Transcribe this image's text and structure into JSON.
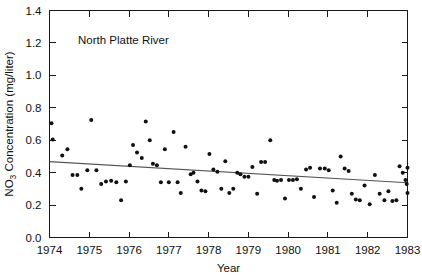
{
  "chart_data": {
    "type": "scatter",
    "title": "",
    "annotation": "North Platte River",
    "xlabel": "Year",
    "ylabel_main": "Concentration (mg/liter)",
    "ylabel_prefix": "NO",
    "ylabel_subscript": "3",
    "xlim": [
      1974,
      1983
    ],
    "ylim": [
      0.0,
      1.4
    ],
    "xticks": [
      1974,
      1975,
      1976,
      1977,
      1978,
      1979,
      1980,
      1981,
      1982,
      1983
    ],
    "xtick_labels": [
      "1974",
      "1975",
      "1976",
      "1977",
      "1978",
      "1979",
      "1980",
      "1981",
      "1982",
      "1983"
    ],
    "yticks": [
      0.0,
      0.2,
      0.4,
      0.6,
      0.8,
      1.0,
      1.2,
      1.4
    ],
    "ytick_labels": [
      "0.0",
      "0.2",
      "0.4",
      "0.6",
      "0.8",
      "1.0",
      "1.2",
      "1.4"
    ],
    "grid": false,
    "legend": "none",
    "marker": "filled-circle",
    "marker_color": "#111111",
    "trendline": {
      "color": "#555555",
      "x": [
        1974.0,
        1983.0
      ],
      "y": [
        0.468,
        0.338
      ]
    },
    "points": [
      {
        "x": 1974.05,
        "y": 0.705
      },
      {
        "x": 1974.08,
        "y": 0.605
      },
      {
        "x": 1974.32,
        "y": 0.505
      },
      {
        "x": 1974.45,
        "y": 0.545
      },
      {
        "x": 1974.58,
        "y": 0.385
      },
      {
        "x": 1974.7,
        "y": 0.385
      },
      {
        "x": 1974.8,
        "y": 0.3
      },
      {
        "x": 1974.95,
        "y": 0.415
      },
      {
        "x": 1975.05,
        "y": 0.725
      },
      {
        "x": 1975.18,
        "y": 0.415
      },
      {
        "x": 1975.3,
        "y": 0.33
      },
      {
        "x": 1975.42,
        "y": 0.345
      },
      {
        "x": 1975.55,
        "y": 0.35
      },
      {
        "x": 1975.68,
        "y": 0.34
      },
      {
        "x": 1975.8,
        "y": 0.23
      },
      {
        "x": 1975.92,
        "y": 0.345
      },
      {
        "x": 1976.02,
        "y": 0.445
      },
      {
        "x": 1976.1,
        "y": 0.57
      },
      {
        "x": 1976.2,
        "y": 0.525
      },
      {
        "x": 1976.32,
        "y": 0.49
      },
      {
        "x": 1976.42,
        "y": 0.715
      },
      {
        "x": 1976.52,
        "y": 0.6
      },
      {
        "x": 1976.6,
        "y": 0.455
      },
      {
        "x": 1976.7,
        "y": 0.445
      },
      {
        "x": 1976.8,
        "y": 0.34
      },
      {
        "x": 1976.9,
        "y": 0.545
      },
      {
        "x": 1977.0,
        "y": 0.34
      },
      {
        "x": 1977.12,
        "y": 0.65
      },
      {
        "x": 1977.22,
        "y": 0.34
      },
      {
        "x": 1977.3,
        "y": 0.275
      },
      {
        "x": 1977.42,
        "y": 0.56
      },
      {
        "x": 1977.55,
        "y": 0.39
      },
      {
        "x": 1977.62,
        "y": 0.4
      },
      {
        "x": 1977.72,
        "y": 0.345
      },
      {
        "x": 1977.82,
        "y": 0.29
      },
      {
        "x": 1977.92,
        "y": 0.285
      },
      {
        "x": 1978.02,
        "y": 0.515
      },
      {
        "x": 1978.12,
        "y": 0.42
      },
      {
        "x": 1978.22,
        "y": 0.405
      },
      {
        "x": 1978.32,
        "y": 0.3
      },
      {
        "x": 1978.42,
        "y": 0.47
      },
      {
        "x": 1978.52,
        "y": 0.275
      },
      {
        "x": 1978.62,
        "y": 0.3
      },
      {
        "x": 1978.72,
        "y": 0.4
      },
      {
        "x": 1978.8,
        "y": 0.39
      },
      {
        "x": 1978.9,
        "y": 0.375
      },
      {
        "x": 1979.0,
        "y": 0.375
      },
      {
        "x": 1979.1,
        "y": 0.435
      },
      {
        "x": 1979.22,
        "y": 0.27
      },
      {
        "x": 1979.32,
        "y": 0.465
      },
      {
        "x": 1979.42,
        "y": 0.465
      },
      {
        "x": 1979.55,
        "y": 0.6
      },
      {
        "x": 1979.65,
        "y": 0.355
      },
      {
        "x": 1979.72,
        "y": 0.35
      },
      {
        "x": 1979.82,
        "y": 0.355
      },
      {
        "x": 1979.92,
        "y": 0.24
      },
      {
        "x": 1980.02,
        "y": 0.355
      },
      {
        "x": 1980.12,
        "y": 0.355
      },
      {
        "x": 1980.22,
        "y": 0.36
      },
      {
        "x": 1980.32,
        "y": 0.3
      },
      {
        "x": 1980.45,
        "y": 0.42
      },
      {
        "x": 1980.55,
        "y": 0.43
      },
      {
        "x": 1980.65,
        "y": 0.25
      },
      {
        "x": 1980.8,
        "y": 0.425
      },
      {
        "x": 1980.92,
        "y": 0.425
      },
      {
        "x": 1981.02,
        "y": 0.415
      },
      {
        "x": 1981.12,
        "y": 0.29
      },
      {
        "x": 1981.22,
        "y": 0.215
      },
      {
        "x": 1981.32,
        "y": 0.5
      },
      {
        "x": 1981.42,
        "y": 0.425
      },
      {
        "x": 1981.52,
        "y": 0.41
      },
      {
        "x": 1981.6,
        "y": 0.27
      },
      {
        "x": 1981.7,
        "y": 0.235
      },
      {
        "x": 1981.8,
        "y": 0.23
      },
      {
        "x": 1981.92,
        "y": 0.32
      },
      {
        "x": 1982.05,
        "y": 0.205
      },
      {
        "x": 1982.18,
        "y": 0.385
      },
      {
        "x": 1982.3,
        "y": 0.27
      },
      {
        "x": 1982.42,
        "y": 0.23
      },
      {
        "x": 1982.52,
        "y": 0.285
      },
      {
        "x": 1982.62,
        "y": 0.225
      },
      {
        "x": 1982.72,
        "y": 0.23
      },
      {
        "x": 1982.8,
        "y": 0.44
      },
      {
        "x": 1982.88,
        "y": 0.4
      },
      {
        "x": 1982.95,
        "y": 0.355
      },
      {
        "x": 1983.0,
        "y": 0.43
      },
      {
        "x": 1983.0,
        "y": 0.275
      },
      {
        "x": 1982.98,
        "y": 0.33
      }
    ]
  }
}
